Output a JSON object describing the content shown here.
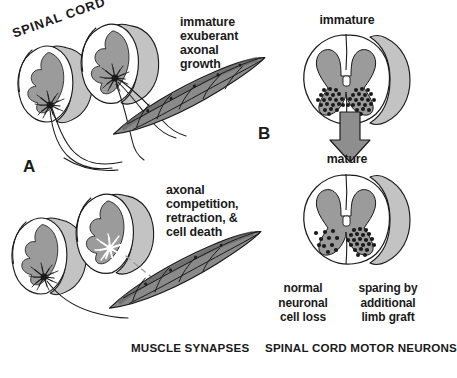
{
  "figure": {
    "type": "scientific-diagram",
    "background_color": "#ffffff",
    "ink_color": "#1a1a1a",
    "palette": {
      "white_matter": "#ffffff",
      "gray_matter": "#9b9b9b",
      "outer_sheath": "#c3c3c3",
      "muscle_fill": "#8a8a8a",
      "muscle_shadow": "#5d5d5d",
      "neuron_dark": "#1a1a1a",
      "neuron_dying": "#ffffff",
      "arrow_fill": "#8e8e8e",
      "outline": "#1a1a1a"
    }
  },
  "panel_a": {
    "id": "A",
    "label": "A",
    "spinal_cord_label": "SPINAL CORD",
    "caption": "MUSCLE SYNAPSES",
    "stages": [
      {
        "id": "immature",
        "annotation_lines": [
          "immature",
          "exuberant",
          "axonal",
          "growth"
        ],
        "annotation_text": "immature exuberant axonal growth",
        "neurons": 2,
        "neuron_state": "alive",
        "axons_to_muscle": 4,
        "description": "Two hemisected cord segments each with a surviving motor neuron projecting many exuberant axons onto one muscle"
      },
      {
        "id": "mature",
        "annotation_lines": [
          "axonal",
          "competition,",
          "retraction, &",
          "cell death"
        ],
        "annotation_text": "axonal competition, retraction, & cell death",
        "neurons": 2,
        "neuron_state": "one alive, one dying",
        "axons_to_muscle": 1,
        "retracted_axon_style": "dashed",
        "description": "One neuron survives with a single axon; the second neuron is shown white (dying) with its axon retracted, drawn as a dashed line"
      }
    ]
  },
  "panel_b": {
    "id": "B",
    "label": "B",
    "caption": "SPINAL CORD MOTOR NEURONS",
    "arrow": "down-arrow",
    "sections": [
      {
        "id": "immature",
        "title": "immature",
        "left_horn_neuron_count": 31,
        "right_horn_neuron_count": 31,
        "note": "Equal, dense motor neuron pools in both ventral horns"
      },
      {
        "id": "mature",
        "title": "mature",
        "left_horn_neuron_count": 11,
        "right_horn_neuron_count": 22,
        "note": "Left horn reduced by naturally occurring cell death; right horn spared by an additional limb graft"
      }
    ],
    "sublabels": [
      {
        "id": "left",
        "lines": [
          "normal",
          "neuronal",
          "cell loss"
        ],
        "text": "normal neuronal cell loss"
      },
      {
        "id": "right",
        "lines": [
          "sparing by",
          "additional",
          "limb graft"
        ],
        "text": "sparing by additional limb graft"
      }
    ]
  }
}
